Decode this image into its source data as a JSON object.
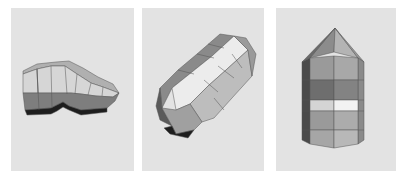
{
  "figure": {
    "panels": [
      {
        "id": "p1",
        "label": "",
        "view": "side-oblique low-poly prism"
      },
      {
        "id": "p2",
        "label": "",
        "view": "diagonal oblique pointed prism"
      },
      {
        "id": "p3",
        "label": "",
        "view": "upright pointed octagonal prism"
      }
    ]
  },
  "colors": {
    "background": "#e3e3e3",
    "light_face": "#d9d9d9",
    "mid_face": "#a8a8a8",
    "dark_face": "#7a7a7a",
    "darkest_face": "#1e1e1e",
    "highlight_face": "#f0f0f0"
  }
}
